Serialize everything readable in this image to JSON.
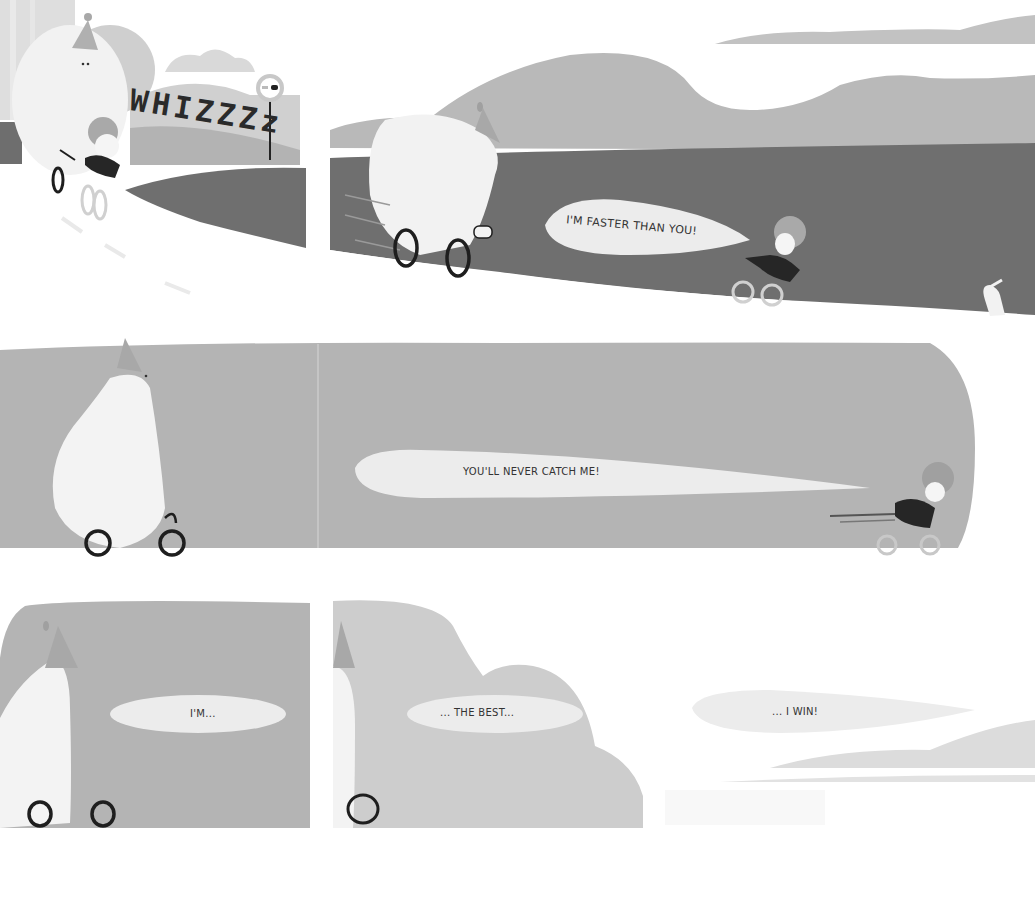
{
  "page": {
    "type": "picture-book spread",
    "palette": {
      "background": "#ffffff",
      "road_dark": "#6f6f6f",
      "hill": "#b9b9b9",
      "panel_gray": "#b4b4b4",
      "panel_light": "#cdcdcd",
      "bubble": "#ececec",
      "character_white": "#f4f4f4",
      "outline": "#1e1e1e"
    }
  },
  "panels": [
    {
      "id": "panel-1",
      "sound_effect": "WHIZZZz",
      "scene": "bear with party hat and child on bicycle passing road sign"
    },
    {
      "id": "panel-2",
      "speech": "I'M FASTER THAN YOU!",
      "scene": "bear on bicycle chasing child on bicycle along road with hills, rabbit at right"
    },
    {
      "id": "panel-3",
      "speech": "YOU'LL NEVER CATCH ME!",
      "scene": "bear on bicycle left, child riding away at right"
    },
    {
      "id": "panel-4",
      "speech": "I'M..."
    },
    {
      "id": "panel-5",
      "speech": "... THE BEST..."
    },
    {
      "id": "panel-6",
      "speech": "... I WIN!"
    }
  ]
}
